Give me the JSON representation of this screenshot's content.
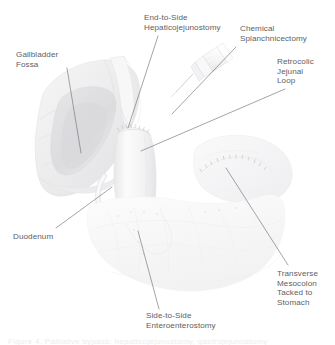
{
  "figure": {
    "background_color": "#ffffff",
    "label_color": "#5e5e62",
    "leader_color": "#6d6d72",
    "caption_text": "Figure 4.  Palliative bypass: hepaticojejunostomy, gastrojejunostomy"
  },
  "labels": [
    {
      "id": "gallbladder-fossa",
      "name": "Gallbladder Fossa",
      "text": "Gallbladder\nFossa",
      "x": 16,
      "y": 50,
      "leader": {
        "x1": 67,
        "y1": 68,
        "x2": 81,
        "y2": 153
      }
    },
    {
      "id": "end-to-side-hepaticojejunostomy",
      "name": "End-to-Side Hepaticojejunostomy",
      "text": "End-to-Side\nHepaticojejunostomy",
      "x": 144,
      "y": 13,
      "leader": {
        "x1": 158,
        "y1": 36,
        "x2": 128,
        "y2": 128
      }
    },
    {
      "id": "chemical-splanchnicectomy",
      "name": "Chemical Splanchnicectomy",
      "text": "Chemical\nSplanchnicectomy",
      "x": 240,
      "y": 24,
      "leader": {
        "x1": 236,
        "y1": 47,
        "x2": 172,
        "y2": 114
      }
    },
    {
      "id": "retrocolic-jejunal-loop",
      "name": "Retrocolic Jejunal Loop",
      "text": "Retrocolic\nJejunal\nLoop",
      "x": 277,
      "y": 57,
      "leader": {
        "x1": 285,
        "y1": 89,
        "x2": 141,
        "y2": 151
      }
    },
    {
      "id": "duodenum",
      "name": "Duodenum",
      "text": "Duodenum",
      "x": 13,
      "y": 232,
      "leader": {
        "x1": 56,
        "y1": 228,
        "x2": 112,
        "y2": 187
      }
    },
    {
      "id": "side-to-side-enteroenterostomy",
      "name": "Side-to-Side Enteroenterostomy",
      "text": "Side-to-Side\nEnteroenterostomy",
      "x": 146,
      "y": 311,
      "leader": {
        "x1": 159,
        "y1": 309,
        "x2": 138,
        "y2": 231
      }
    },
    {
      "id": "transverse-mesocolon-tacked-to-stomach",
      "name": "Transverse Mesocolon Tacked to Stomach",
      "text": "Transverse\nMesocolon\nTacked to\nStomach",
      "x": 277,
      "y": 269,
      "leader": {
        "x1": 288,
        "y1": 265,
        "x2": 226,
        "y2": 168
      }
    }
  ],
  "anatomy": [
    {
      "id": "liver",
      "name": "liver"
    },
    {
      "id": "gallbladder-fossa-bed",
      "name": "gallbladder fossa bed"
    },
    {
      "id": "jejunal-loop",
      "name": "retrocolic jejunal loop"
    },
    {
      "id": "duodenum-body",
      "name": "duodenum"
    },
    {
      "id": "stomach",
      "name": "stomach"
    },
    {
      "id": "bowel-loops",
      "name": "small bowel loops"
    },
    {
      "id": "transverse-mesocolon",
      "name": "transverse mesocolon"
    },
    {
      "id": "syringe",
      "name": "splanchnicectomy syringe and needle"
    },
    {
      "id": "anastomosis-sutures",
      "name": "hepaticojejunostomy sutures"
    },
    {
      "id": "tacking-sutures",
      "name": "mesocolon tacking sutures"
    }
  ]
}
